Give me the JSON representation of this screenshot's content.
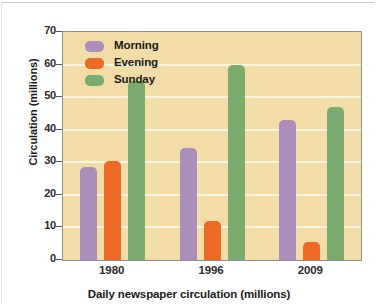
{
  "chart_data": {
    "type": "bar",
    "title": "",
    "xlabel": "Daily newspaper circulation (millions)",
    "ylabel": "Circulation (millions)",
    "categories": [
      "1980",
      "1996",
      "2009"
    ],
    "series": [
      {
        "name": "Morning",
        "color": "#ab8fba",
        "values": [
          28.5,
          34.5,
          43
        ]
      },
      {
        "name": "Evening",
        "color": "#ec6a26",
        "values": [
          30.5,
          12,
          5.5
        ]
      },
      {
        "name": "Sunday",
        "color": "#7cab6f",
        "values": [
          55,
          60,
          47
        ]
      }
    ],
    "ylim": [
      0,
      70
    ],
    "yticks": [
      0,
      10,
      20,
      30,
      40,
      50,
      60,
      70
    ],
    "ytick_labels": [
      "0",
      "10",
      "20",
      "30",
      "40",
      "50",
      "60",
      "70"
    ],
    "grid": true,
    "legend_position": "top-left-inside",
    "plot_background": "#f2dca8",
    "gridline_color": "#fbf4e0"
  },
  "legend": {
    "items": [
      {
        "label": "Morning",
        "swatch": "morning"
      },
      {
        "label": "Evening",
        "swatch": "evening"
      },
      {
        "label": "Sunday",
        "swatch": "sunday"
      }
    ]
  }
}
